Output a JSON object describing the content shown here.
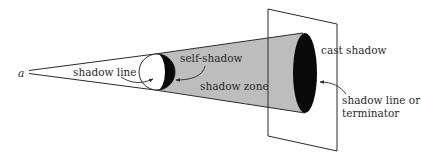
{
  "diagram": {
    "type": "shadow-cone-illustration",
    "colors": {
      "line": "#2a2a2a",
      "shadow_zone_fill": "#bdbdbd",
      "shadow_fill": "#0a0a0a",
      "light_fill": "#ffffff"
    },
    "labels": {
      "light_source": "a",
      "shadow_line": "shadow line",
      "self_shadow": "self-shadow",
      "shadow_zone": "shadow zone",
      "cast_shadow": "cast shadow",
      "terminator_line1": "shadow line or",
      "terminator_line2": "terminator"
    }
  }
}
